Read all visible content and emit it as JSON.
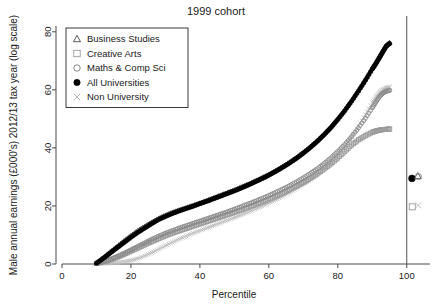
{
  "chart_data": {
    "type": "scatter",
    "title": "1999 cohort",
    "xlabel": "Percentile",
    "ylabel": "Male annual earnings (£000's) 2012/13 tax year (log scale)",
    "xlim": [
      0,
      105
    ],
    "ylim": [
      0,
      82
    ],
    "xticks": [
      0,
      20,
      40,
      60,
      80,
      100
    ],
    "yticks": [
      0,
      20,
      40,
      60,
      80
    ],
    "grid": false,
    "legend_position": "top-left",
    "legend": [
      {
        "label": "Business Studies",
        "marker": "triangle",
        "color": "#444444"
      },
      {
        "label": "Creative Arts",
        "marker": "square",
        "color": "#9a9a9a"
      },
      {
        "label": "Maths & Comp Sci",
        "marker": "circle-open",
        "color": "#7a7a7a"
      },
      {
        "label": "All Universities",
        "marker": "circle-filled",
        "color": "#000000"
      },
      {
        "label": "Non University",
        "marker": "cross",
        "color": "#b0b0b0"
      }
    ],
    "series": [
      {
        "name": "All Universities",
        "marker": "circle-filled",
        "color": "#000000",
        "x": [
          10,
          12,
          14,
          16,
          18,
          20,
          22,
          24,
          26,
          28,
          30,
          32,
          34,
          36,
          38,
          40,
          42,
          44,
          46,
          48,
          50,
          52,
          54,
          56,
          58,
          60,
          62,
          64,
          66,
          68,
          70,
          72,
          74,
          76,
          78,
          80,
          82,
          84,
          86,
          88,
          90,
          91,
          92,
          93,
          94,
          95
        ],
        "y": [
          0.3,
          2.0,
          3.8,
          5.6,
          7.4,
          9.2,
          10.9,
          12.4,
          13.9,
          15.3,
          16.4,
          17.4,
          18.3,
          19.1,
          19.9,
          20.8,
          21.6,
          22.5,
          23.4,
          24.3,
          25.2,
          26.2,
          27.2,
          28.3,
          29.4,
          30.6,
          31.9,
          33.3,
          34.8,
          36.4,
          38.2,
          40.1,
          42.2,
          44.5,
          47.0,
          49.8,
          52.8,
          56.1,
          59.6,
          63.3,
          67.2,
          69.0,
          71.0,
          73.0,
          75.0,
          76.0
        ]
      },
      {
        "name": "Business Studies",
        "marker": "triangle",
        "color": "#444444",
        "x": [
          10,
          12,
          14,
          16,
          18,
          20,
          22,
          24,
          26,
          28,
          30,
          32,
          34,
          36,
          38,
          40,
          42,
          44,
          46,
          48,
          50,
          52,
          54,
          56,
          58,
          60,
          62,
          64,
          66,
          68,
          70,
          72,
          74,
          76,
          78,
          80,
          82,
          84,
          86,
          88,
          90,
          91,
          92,
          93,
          94,
          95
        ],
        "y": [
          0.3,
          2.2,
          4.2,
          6.1,
          8.0,
          9.8,
          11.5,
          13.0,
          14.4,
          15.7,
          16.8,
          17.8,
          18.6,
          19.4,
          20.2,
          21.0,
          21.9,
          22.8,
          23.7,
          24.6,
          25.5,
          26.5,
          27.5,
          28.6,
          29.7,
          30.9,
          32.2,
          33.6,
          35.1,
          36.7,
          38.5,
          40.4,
          42.5,
          44.8,
          47.3,
          50.1,
          53.1,
          56.4,
          59.9,
          63.6,
          67.5,
          69.3,
          71.3,
          73.3,
          75.2,
          76.2
        ]
      },
      {
        "name": "Maths & Comp Sci",
        "marker": "circle-open",
        "color": "#8a8a8a",
        "x": [
          10,
          12,
          14,
          16,
          18,
          20,
          22,
          24,
          26,
          28,
          30,
          32,
          34,
          36,
          38,
          40,
          42,
          44,
          46,
          48,
          50,
          52,
          54,
          56,
          58,
          60,
          62,
          64,
          66,
          68,
          70,
          72,
          74,
          76,
          78,
          80,
          82,
          84,
          86,
          88,
          90,
          91,
          92,
          93,
          94,
          95
        ],
        "y": [
          0.2,
          0.8,
          1.6,
          2.6,
          3.7,
          4.9,
          6.1,
          7.3,
          8.5,
          9.6,
          10.6,
          11.5,
          12.4,
          13.2,
          14.0,
          14.8,
          15.6,
          16.4,
          17.2,
          18.0,
          18.9,
          19.8,
          20.7,
          21.6,
          22.6,
          23.6,
          24.7,
          25.8,
          27.0,
          28.3,
          29.7,
          31.2,
          32.8,
          34.6,
          36.6,
          38.8,
          41.2,
          43.9,
          46.9,
          50.2,
          53.8,
          55.7,
          57.5,
          58.8,
          59.5,
          59.8
        ]
      },
      {
        "name": "Creative Arts",
        "marker": "square",
        "color": "#9a9a9a",
        "x": [
          10,
          12,
          14,
          16,
          18,
          20,
          22,
          24,
          26,
          28,
          30,
          32,
          34,
          36,
          38,
          40,
          42,
          44,
          46,
          48,
          50,
          52,
          54,
          56,
          58,
          60,
          62,
          64,
          66,
          68,
          70,
          72,
          74,
          76,
          78,
          80,
          82,
          84,
          86,
          88,
          90,
          91,
          92,
          93,
          94,
          95
        ],
        "y": [
          0.2,
          0.7,
          1.4,
          2.3,
          3.3,
          4.4,
          5.5,
          6.6,
          7.7,
          8.7,
          9.7,
          10.6,
          11.4,
          12.2,
          13.0,
          13.8,
          14.6,
          15.4,
          16.2,
          17.0,
          17.8,
          18.6,
          19.5,
          20.4,
          21.3,
          22.3,
          23.3,
          24.4,
          25.6,
          26.8,
          28.1,
          29.5,
          31.0,
          32.7,
          34.5,
          36.5,
          38.7,
          41.0,
          42.8,
          44.2,
          45.4,
          45.8,
          46.1,
          46.3,
          46.4,
          46.5
        ]
      },
      {
        "name": "Non University",
        "marker": "cross",
        "color": "#bdbdbd",
        "x": [
          10,
          12,
          14,
          16,
          18,
          20,
          22,
          24,
          26,
          28,
          30,
          32,
          34,
          36,
          38,
          40,
          42,
          44,
          46,
          48,
          50,
          52,
          54,
          56,
          58,
          60,
          62,
          64,
          66,
          68,
          70,
          72,
          74,
          76,
          78,
          80,
          82,
          84,
          86,
          88,
          90,
          91,
          92,
          93,
          94,
          95
        ],
        "y": [
          0.1,
          0.2,
          0.3,
          0.5,
          0.8,
          1.2,
          1.9,
          2.8,
          3.9,
          5.1,
          6.3,
          7.5,
          8.6,
          9.6,
          10.6,
          11.5,
          12.4,
          13.3,
          14.2,
          15.1,
          16.0,
          16.9,
          17.9,
          18.9,
          19.9,
          21.0,
          22.1,
          23.3,
          24.6,
          26.0,
          27.5,
          29.1,
          30.9,
          32.9,
          35.1,
          37.6,
          40.5,
          43.8,
          47.5,
          51.5,
          55.7,
          57.5,
          59.0,
          60.0,
          60.6,
          61.0
        ]
      }
    ],
    "mean_markers": [
      {
        "name": "All Universities",
        "marker": "circle-filled",
        "color": "#000000",
        "x": 101.5,
        "y": 29.5
      },
      {
        "name": "Business Studies",
        "marker": "triangle",
        "color": "#555555",
        "x": 103.2,
        "y": 30.3
      },
      {
        "name": "Maths & Comp Sci",
        "marker": "circle-open",
        "color": "#777777",
        "x": 103.4,
        "y": 30.1
      },
      {
        "name": "Creative Arts",
        "marker": "square",
        "color": "#9a9a9a",
        "x": 101.6,
        "y": 19.7
      },
      {
        "name": "Non University",
        "marker": "cross",
        "color": "#b5b5b5",
        "x": 103.3,
        "y": 20.2
      }
    ],
    "reference_line": {
      "orientation": "vertical",
      "x": 100
    }
  }
}
